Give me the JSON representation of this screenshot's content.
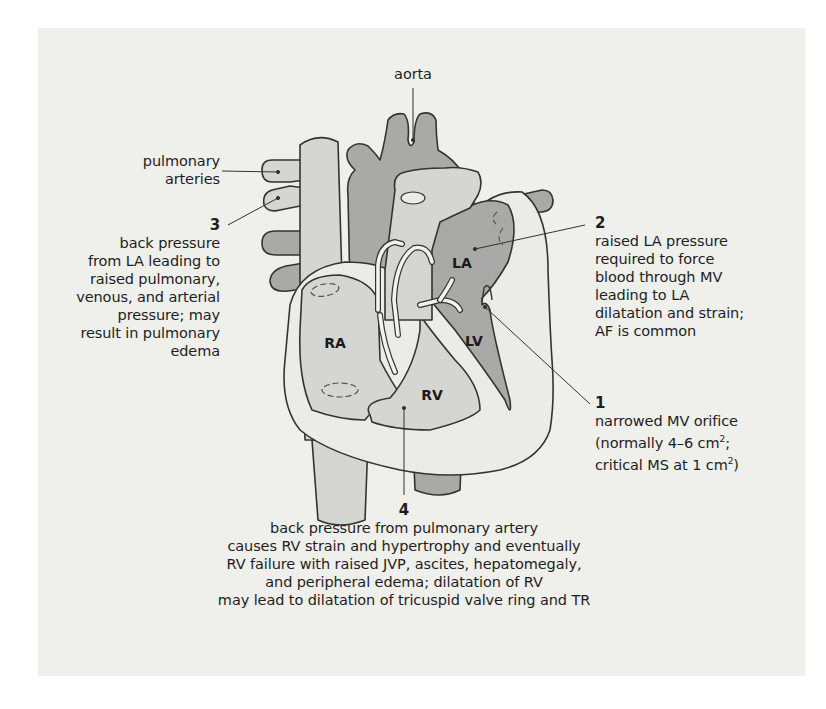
{
  "figure": {
    "topic": "Mitral stenosis pathophysiology",
    "colors": {
      "panel_bg": "#efefec",
      "dark_fill": "#a9a9a7",
      "light_fill": "#d5d5d2",
      "wall_fill": "#ebebe8",
      "outline": "#333333"
    },
    "structure_labels": {
      "aorta": "aorta",
      "pulmonary_arteries_line1": "pulmonary",
      "pulmonary_arteries_line2": "arteries"
    },
    "chambers": {
      "la": "LA",
      "lv": "LV",
      "ra": "RA",
      "rv": "RV"
    },
    "annotations": [
      {
        "number": "1",
        "lines": [
          "narrowed MV orifice",
          "(normally 4–6 cm",
          "2",
          ";",
          "critical MS at 1 cm",
          "2",
          ")"
        ]
      },
      {
        "number": "2",
        "lines": [
          "raised LA pressure",
          "required to force",
          "blood through MV",
          "leading to LA",
          "dilatation and strain;",
          "AF is common"
        ]
      },
      {
        "number": "3",
        "lines": [
          "back pressure",
          "from LA leading to",
          "raised pulmonary,",
          "venous, and arterial",
          "pressure; may",
          "result in pulmonary",
          "edema"
        ]
      },
      {
        "number": "4",
        "lines": [
          "back pressure from pulmonary artery",
          "causes RV strain and hypertrophy and eventually",
          "RV failure with raised JVP, ascites, hepatomegaly,",
          "and peripheral edema; dilatation of RV",
          "may lead to dilatation of tricuspid valve ring and TR"
        ]
      }
    ]
  }
}
